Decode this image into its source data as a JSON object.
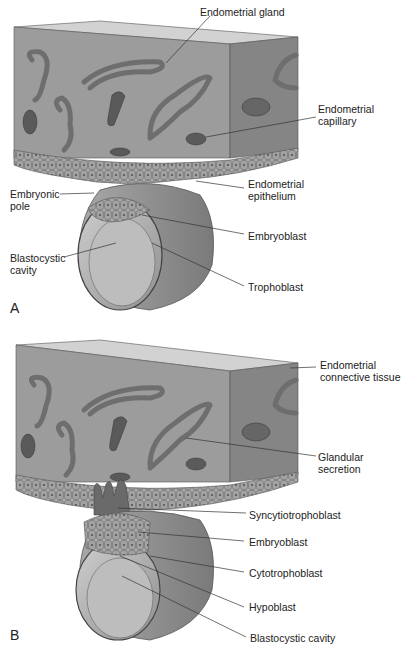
{
  "figure": {
    "panels": [
      {
        "letter": "A",
        "labels": {
          "endometrial_gland": "Endometrial gland",
          "endometrial_capillary": "Endometrial\ncapillary",
          "endometrial_epithelium": "Endometrial\nepithelium",
          "embryonic_pole": "Embryonic\npole",
          "embryoblast": "Embryoblast",
          "blastocystic_cavity": "Blastocystic\ncavity",
          "trophoblast": "Trophoblast"
        }
      },
      {
        "letter": "B",
        "labels": {
          "endometrial_connective_tissue": "Endometrial\nconnective tissue",
          "glandular_secretion": "Glandular\nsecretion",
          "syncytiotrophoblast": "Syncytiotrophoblast",
          "embryoblast": "Embryoblast",
          "cytotrophoblast": "Cytotrophoblast",
          "hypoblast": "Hypoblast",
          "blastocystic_cavity": "Blastocystic cavity"
        }
      }
    ],
    "colors": {
      "tissue_front": "#9a9a9a",
      "tissue_top": "#cfcfcf",
      "tissue_side": "#7f7f7f",
      "gland_wall": "#8a8a8a",
      "gland_lumen": "#d8d8d8",
      "capillary": "#555555",
      "blastocyst": "#8c8c8c",
      "cavity": "#b5b5b5",
      "leader_line": "#333333"
    }
  }
}
